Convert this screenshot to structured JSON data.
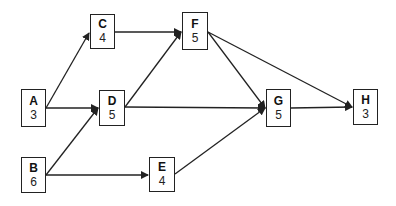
{
  "diagram": {
    "type": "activity-on-node network",
    "nodes": [
      {
        "id": "A",
        "label": "A",
        "duration": "3",
        "x": 21,
        "y": 89,
        "w": 25,
        "h": 38
      },
      {
        "id": "B",
        "label": "B",
        "duration": "6",
        "x": 21,
        "y": 157,
        "w": 25,
        "h": 36
      },
      {
        "id": "C",
        "label": "C",
        "duration": "4",
        "x": 90,
        "y": 14,
        "w": 25,
        "h": 35
      },
      {
        "id": "D",
        "label": "D",
        "duration": "5",
        "x": 99,
        "y": 90,
        "w": 26,
        "h": 36
      },
      {
        "id": "E",
        "label": "E",
        "duration": "4",
        "x": 149,
        "y": 157,
        "w": 26,
        "h": 35
      },
      {
        "id": "F",
        "label": "F",
        "duration": "5",
        "x": 182,
        "y": 12,
        "w": 26,
        "h": 38
      },
      {
        "id": "G",
        "label": "G",
        "duration": "5",
        "x": 266,
        "y": 89,
        "w": 25,
        "h": 38
      },
      {
        "id": "H",
        "label": "H",
        "duration": "3",
        "x": 353,
        "y": 89,
        "w": 25,
        "h": 36
      }
    ],
    "edges": [
      {
        "from": "A",
        "to": "C"
      },
      {
        "from": "A",
        "to": "D"
      },
      {
        "from": "B",
        "to": "D"
      },
      {
        "from": "B",
        "to": "E"
      },
      {
        "from": "C",
        "to": "F"
      },
      {
        "from": "D",
        "to": "F"
      },
      {
        "from": "D",
        "to": "G"
      },
      {
        "from": "E",
        "to": "G"
      },
      {
        "from": "F",
        "to": "G"
      },
      {
        "from": "F",
        "to": "H"
      },
      {
        "from": "G",
        "to": "H"
      }
    ],
    "colors": {
      "line": "#222222",
      "box_border": "#222222",
      "background": "#ffffff"
    }
  }
}
